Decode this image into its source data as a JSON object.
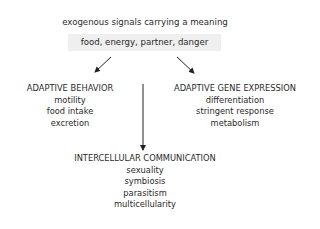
{
  "diagram": {
    "title": "exogenous signals carrying a meaning",
    "signals_box": "food, energy, partner, danger",
    "nodes": {
      "behavior": {
        "heading": "ADAPTIVE BEHAVIOR",
        "items": [
          "motility",
          "food intake",
          "excretion"
        ]
      },
      "gene_expression": {
        "heading": "ADAPTIVE GENE EXPRESSION",
        "items": [
          "differentiation",
          "stringent response",
          "metabolism"
        ]
      },
      "communication": {
        "heading": "INTERCELLULAR COMMUNICATION",
        "items": [
          "sexuality",
          "symbiosis",
          "parasitism",
          "multicellularity"
        ]
      }
    },
    "edges": [
      {
        "from": "signals_box",
        "to": "behavior"
      },
      {
        "from": "signals_box",
        "to": "gene_expression"
      },
      {
        "from": "between_behavior_and_gene_expression",
        "to": "communication"
      }
    ],
    "colors": {
      "box_fill": "#efefef",
      "text": "#2a2a2a",
      "arrow": "#222222"
    }
  }
}
